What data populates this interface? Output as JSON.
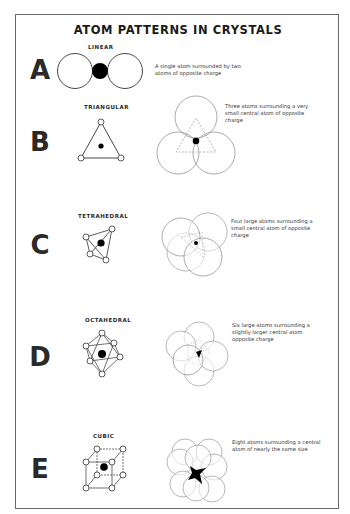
{
  "poster": {
    "title": "ATOM PATTERNS IN CRYSTALS",
    "colors": {
      "ink": "#2a2a2a",
      "frame": "#6a6a6a",
      "background": "#ffffff",
      "atom_fill": "#000000"
    },
    "rows": [
      {
        "letter": "A",
        "pattern": "LINEAR",
        "description": "A single atom surrounded by two atoms of opposite charge"
      },
      {
        "letter": "B",
        "pattern": "TRIANGULAR",
        "description": "Three atoms surrounding a very small central atom of opposite charge"
      },
      {
        "letter": "C",
        "pattern": "TETRAHEDRAL",
        "description": "Four large atoms surrounding a small central atom of opposite charge"
      },
      {
        "letter": "D",
        "pattern": "OCTAHEDRAL",
        "description": "Six large atoms surrounding a slightly larger central atom opposite charge"
      },
      {
        "letter": "E",
        "pattern": "CUBIC",
        "description": "Eight atoms surrounding a central atom of nearly the same size"
      }
    ]
  }
}
